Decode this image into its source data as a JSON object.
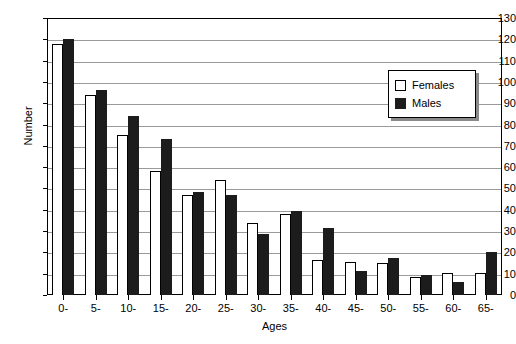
{
  "chart_data": {
    "type": "bar",
    "title": "",
    "xlabel": "Ages",
    "ylabel": "Number",
    "ylim": [
      0,
      130
    ],
    "ytick_step": 10,
    "yticks": [
      0,
      10,
      20,
      30,
      40,
      50,
      60,
      70,
      80,
      90,
      100,
      110,
      120,
      130
    ],
    "grid": true,
    "legend_position": "upper-right-inside",
    "categories": [
      "0-",
      "5-",
      "10-",
      "15-",
      "20-",
      "25-",
      "30-",
      "35-",
      "40-",
      "45-",
      "50-",
      "55-",
      "60-",
      "65-"
    ],
    "series": [
      {
        "name": "Females",
        "color": "#ffffff",
        "edge_color": "#000000",
        "values": [
          118,
          94,
          75,
          58,
          47,
          54,
          34,
          38,
          16.5,
          15.5,
          15,
          8.5,
          10.5,
          10.5
        ]
      },
      {
        "name": "Males",
        "color": "#1c1c1c",
        "edge_color": "#1c1c1c",
        "values": [
          120,
          96,
          84,
          73,
          48.5,
          47,
          28.5,
          39.5,
          31.5,
          11.5,
          17.5,
          9.5,
          6,
          20
        ]
      }
    ]
  },
  "axes": {
    "y_title": "Number",
    "x_title": "Ages"
  },
  "legend": {
    "entries": [
      {
        "label": "Females",
        "swatch": "open-square-icon"
      },
      {
        "label": "Males",
        "swatch": "filled-square-icon"
      }
    ]
  }
}
